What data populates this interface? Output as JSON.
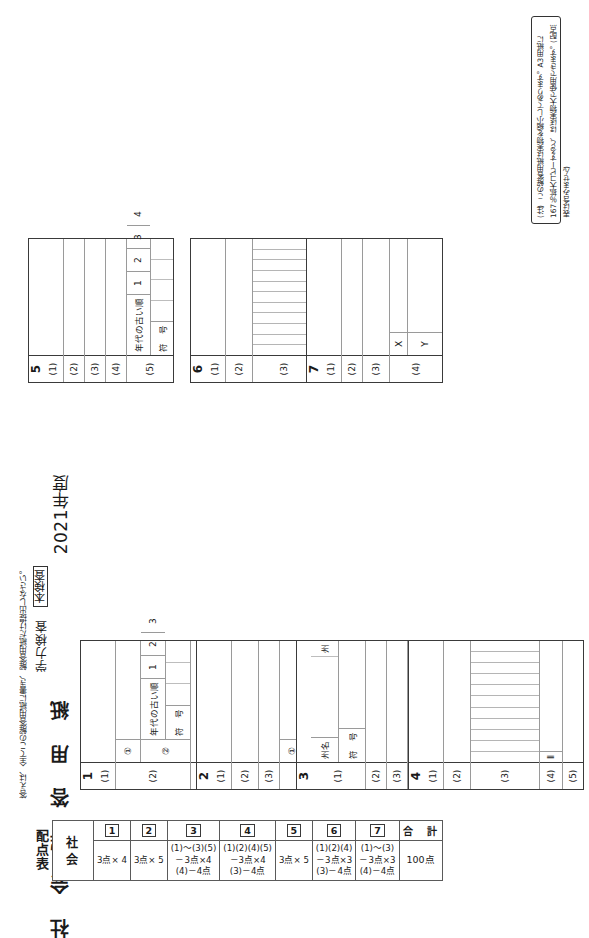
{
  "document": {
    "year": "2021年度",
    "exam_type": "本検査",
    "exam_kind": "学力検査",
    "subject_title": "社 会 解 答 用 紙",
    "instruction": "答えは、全てこの解答用紙に書き、解答用紙だけ提出しなさい。"
  },
  "note": {
    "text": "(注)  この解答用紙は実物を縮小してあります。A3用紙に167％拡大コピーすると、ほぼ実物大で使用できます。(配点表は含みません)"
  },
  "labels": {
    "order_old": "年代の古い順",
    "sign": "符　号",
    "state_name": "州名",
    "state": "州",
    "x": "X",
    "y": "Y",
    "ii": "Ⅱ",
    "sub1": "①",
    "sub2": "②",
    "n1": "1",
    "n2": "2",
    "n3": "3",
    "n4": "4"
  },
  "questions": {
    "q1": {
      "number": "1",
      "rows": [
        "(1)",
        "(2)",
        "(3)"
      ]
    },
    "q2": {
      "number": "2",
      "rows": [
        "(1)",
        "(2)",
        "(3)",
        "(4)"
      ]
    },
    "q3": {
      "number": "3",
      "rows": [
        "(1)",
        "(2)",
        "(3)",
        "(4)",
        "(5)"
      ]
    },
    "q4": {
      "number": "4",
      "rows": [
        "(1)",
        "(2)",
        "(3)",
        "(4)",
        "(5)"
      ]
    },
    "q5": {
      "number": "5",
      "rows": [
        "(1)",
        "(2)",
        "(3)",
        "(4)",
        "(5)"
      ]
    },
    "q6": {
      "number": "6",
      "rows": [
        "(1)",
        "(2)",
        "(3)",
        "(4)"
      ]
    },
    "q7": {
      "number": "7",
      "rows": [
        "(1)",
        "(2)",
        "(3)",
        "(4)"
      ]
    }
  },
  "score_table": {
    "title": "配点表",
    "subject": "社　会",
    "total_header": "合　計",
    "total_value": "100点",
    "columns": [
      {
        "badge": "1",
        "points": "3点× 4"
      },
      {
        "badge": "2",
        "points": "3点× 5"
      },
      {
        "badge": "3",
        "points": "(1)～(3)(5)\n－3点×4\n(4)－4点"
      },
      {
        "badge": "4",
        "points": "(1)(2)(4)(5)\n－3点×4\n(3)－4点"
      },
      {
        "badge": "5",
        "points": "3点× 5"
      },
      {
        "badge": "6",
        "points": "(1)(2)(4)\n－3点×3\n(3)－4点"
      },
      {
        "badge": "7",
        "points": "(1)～(3)\n－3点×3\n(4)－4点"
      }
    ]
  }
}
